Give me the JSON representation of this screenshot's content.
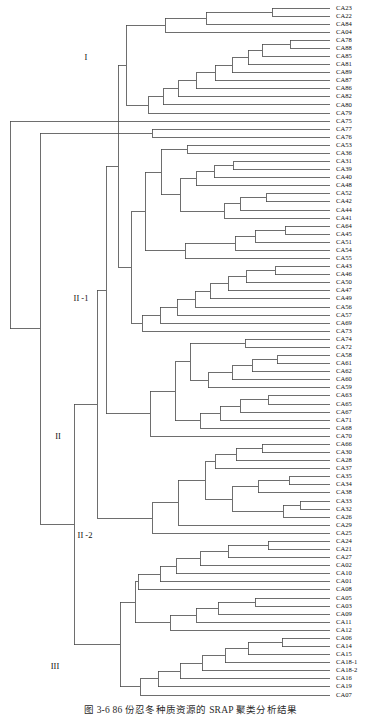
{
  "figure": {
    "caption": "图 3-6   86 份忍冬种质资源的 SRAP 聚类分析结果",
    "cluster_labels": [
      {
        "text": "I",
        "x": 86,
        "y": 58
      },
      {
        "text": "II",
        "x": 58,
        "y": 437
      },
      {
        "text": "II -1",
        "x": 81,
        "y": 299
      },
      {
        "text": "II -2",
        "x": 85,
        "y": 536
      },
      {
        "text": "III",
        "x": 55,
        "y": 667
      }
    ]
  },
  "chart_data": {
    "type": "dendrogram",
    "title": "图 3-6   86 份忍冬种质资源的 SRAP 聚类分析结果",
    "orientation": "left-to-right",
    "n_leaves": 86,
    "grid": false,
    "legend": null,
    "xlabel": "",
    "ylabel": "",
    "leaves": [
      "CA23",
      "CA22",
      "CA84",
      "CA04",
      "CA78",
      "CA88",
      "CA85",
      "CA81",
      "CA89",
      "CA87",
      "CA86",
      "CA82",
      "CA80",
      "CA79",
      "CA75",
      "CA77",
      "CA76",
      "CA53",
      "CA36",
      "CA31",
      "CA39",
      "CA40",
      "CA48",
      "CA52",
      "CA42",
      "CA44",
      "CA41",
      "CA64",
      "CA45",
      "CA51",
      "CA54",
      "CA55",
      "CA43",
      "CA46",
      "CA50",
      "CA47",
      "CA49",
      "CA56",
      "CA57",
      "CA69",
      "CA73",
      "CA74",
      "CA72",
      "CA58",
      "CA61",
      "CA62",
      "CA60",
      "CA59",
      "CA63",
      "CA65",
      "CA67",
      "CA71",
      "CA68",
      "CA70",
      "CA66",
      "CA30",
      "CA28",
      "CA37",
      "CA35",
      "CA34",
      "CA38",
      "CA33",
      "CA32",
      "CA26",
      "CA29",
      "CA25",
      "CA24",
      "CA21",
      "CA27",
      "CA02",
      "CA10",
      "CA01",
      "CA08",
      "CA05",
      "CA03",
      "CA09",
      "CA11",
      "CA12",
      "CA06",
      "CA14",
      "CA15",
      "CA18-1",
      "CA18-2",
      "CA16",
      "CA19",
      "CA07"
    ],
    "merges": [
      {
        "x": 272,
        "children_y": [
          8,
          16
        ]
      },
      {
        "x": 206,
        "children_y": [
          12,
          24
        ]
      },
      {
        "x": 165,
        "children_y": [
          18,
          32
        ]
      },
      {
        "x": 290,
        "children_y": [
          40,
          48
        ]
      },
      {
        "x": 262,
        "children_y": [
          44,
          56
        ]
      },
      {
        "x": 248,
        "children_y": [
          50,
          64
        ]
      },
      {
        "x": 232,
        "children_y": [
          57,
          72
        ]
      },
      {
        "x": 215,
        "children_y": [
          64,
          80
        ]
      },
      {
        "x": 196,
        "children_y": [
          72,
          88
        ]
      },
      {
        "x": 178,
        "children_y": [
          80,
          96
        ]
      },
      {
        "x": 163,
        "children_y": [
          88,
          104
        ]
      },
      {
        "x": 148,
        "children_y": [
          96,
          112
        ]
      },
      {
        "x": 126,
        "children_y": [
          25,
          104
        ]
      },
      {
        "x": 152,
        "children_y": [
          129,
          137
        ]
      },
      {
        "x": 187,
        "children_y": [
          145,
          153
        ]
      },
      {
        "x": 233,
        "children_y": [
          161,
          169
        ]
      },
      {
        "x": 214,
        "children_y": [
          165,
          177
        ]
      },
      {
        "x": 196,
        "children_y": [
          171,
          185
        ]
      },
      {
        "x": 266,
        "children_y": [
          193,
          201
        ]
      },
      {
        "x": 240,
        "children_y": [
          197,
          209
        ]
      },
      {
        "x": 224,
        "children_y": [
          203,
          217
        ]
      },
      {
        "x": 180,
        "children_y": [
          178,
          213
        ]
      },
      {
        "x": 161,
        "children_y": [
          149,
          196
        ]
      },
      {
        "x": 285,
        "children_y": [
          225,
          233
        ]
      },
      {
        "x": 255,
        "children_y": [
          229,
          241
        ]
      },
      {
        "x": 235,
        "children_y": [
          235,
          249
        ]
      },
      {
        "x": 185,
        "children_y": [
          242,
          257
        ]
      },
      {
        "x": 145,
        "children_y": [
          172,
          221
        ]
      },
      {
        "x": 275,
        "children_y": [
          265,
          273
        ]
      },
      {
        "x": 246,
        "children_y": [
          269,
          281
        ]
      },
      {
        "x": 228,
        "children_y": [
          275,
          289
        ]
      },
      {
        "x": 210,
        "children_y": [
          282,
          297
        ]
      },
      {
        "x": 195,
        "children_y": [
          289,
          305
        ]
      },
      {
        "x": 177,
        "children_y": [
          297,
          313
        ]
      },
      {
        "x": 160,
        "children_y": [
          305,
          321
        ]
      },
      {
        "x": 142,
        "children_y": [
          313,
          329
        ]
      },
      {
        "x": 131,
        "children_y": [
          196,
          321
        ]
      },
      {
        "x": 118,
        "children_y": [
          64,
          258
        ]
      },
      {
        "x": 245,
        "children_y": [
          337,
          345
        ]
      },
      {
        "x": 277,
        "children_y": [
          353,
          361
        ]
      },
      {
        "x": 252,
        "children_y": [
          357,
          369
        ]
      },
      {
        "x": 232,
        "children_y": [
          363,
          377
        ]
      },
      {
        "x": 208,
        "children_y": [
          370,
          385
        ]
      },
      {
        "x": 190,
        "children_y": [
          341,
          377
        ]
      },
      {
        "x": 268,
        "children_y": [
          393,
          401
        ]
      },
      {
        "x": 240,
        "children_y": [
          397,
          409
        ]
      },
      {
        "x": 220,
        "children_y": [
          403,
          417
        ]
      },
      {
        "x": 200,
        "children_y": [
          410,
          425
        ]
      },
      {
        "x": 175,
        "children_y": [
          359,
          417
        ]
      },
      {
        "x": 150,
        "children_y": [
          388,
          433
        ]
      },
      {
        "x": 106,
        "children_y": [
          161,
          410
        ]
      },
      {
        "x": 262,
        "children_y": [
          441,
          449
        ]
      },
      {
        "x": 236,
        "children_y": [
          445,
          457
        ]
      },
      {
        "x": 215,
        "children_y": [
          451,
          465
        ]
      },
      {
        "x": 289,
        "children_y": [
          473,
          481
        ]
      },
      {
        "x": 258,
        "children_y": [
          477,
          489
        ]
      },
      {
        "x": 300,
        "children_y": [
          497,
          505
        ]
      },
      {
        "x": 283,
        "children_y": [
          501,
          513
        ]
      },
      {
        "x": 232,
        "children_y": [
          483,
          507
        ]
      },
      {
        "x": 205,
        "children_y": [
          458,
          495
        ]
      },
      {
        "x": 178,
        "children_y": [
          477,
          521
        ]
      },
      {
        "x": 152,
        "children_y": [
          499,
          529
        ]
      },
      {
        "x": 97,
        "children_y": [
          286,
          514
        ]
      },
      {
        "x": 268,
        "children_y": [
          537,
          545
        ]
      },
      {
        "x": 228,
        "children_y": [
          541,
          553
        ]
      },
      {
        "x": 200,
        "children_y": [
          547,
          561
        ]
      },
      {
        "x": 176,
        "children_y": [
          554,
          569
        ]
      },
      {
        "x": 160,
        "children_y": [
          561,
          577
        ]
      },
      {
        "x": 138,
        "children_y": [
          569,
          585
        ]
      },
      {
        "x": 255,
        "children_y": [
          593,
          601
        ]
      },
      {
        "x": 218,
        "children_y": [
          597,
          609
        ]
      },
      {
        "x": 196,
        "children_y": [
          603,
          617
        ]
      },
      {
        "x": 170,
        "children_y": [
          610,
          625
        ]
      },
      {
        "x": 135,
        "children_y": [
          577,
          617
        ]
      },
      {
        "x": 282,
        "children_y": [
          633,
          641
        ]
      },
      {
        "x": 248,
        "children_y": [
          637,
          649
        ]
      },
      {
        "x": 225,
        "children_y": [
          643,
          657
        ]
      },
      {
        "x": 202,
        "children_y": [
          650,
          665
        ]
      },
      {
        "x": 180,
        "children_y": [
          657,
          673
        ]
      },
      {
        "x": 158,
        "children_y": [
          665,
          681
        ]
      },
      {
        "x": 140,
        "children_y": [
          673,
          689
        ]
      },
      {
        "x": 120,
        "children_y": [
          597,
          681
        ]
      },
      {
        "x": 74,
        "children_y": [
          400,
          639
        ]
      },
      {
        "x": 40,
        "children_y": [
          306,
          519
        ]
      }
    ]
  }
}
